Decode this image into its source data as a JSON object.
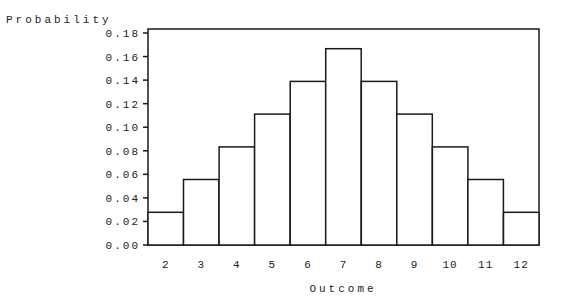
{
  "chart_data": {
    "type": "bar",
    "title": "",
    "xlabel": "Outcome",
    "ylabel": "Probability",
    "categories": [
      "2",
      "3",
      "4",
      "5",
      "6",
      "7",
      "8",
      "9",
      "10",
      "11",
      "12"
    ],
    "values": [
      0.0278,
      0.0556,
      0.0833,
      0.1111,
      0.1389,
      0.1667,
      0.1389,
      0.1111,
      0.0833,
      0.0556,
      0.0278
    ],
    "ylim": [
      0,
      0.18
    ],
    "yticks": [
      "0.00",
      "0.02",
      "0.04",
      "0.06",
      "0.08",
      "0.10",
      "0.12",
      "0.14",
      "0.16",
      "0.18"
    ],
    "grid": false,
    "legend": null,
    "bar_fill": "#ffffff",
    "bar_stroke": "#1a1a1a"
  }
}
